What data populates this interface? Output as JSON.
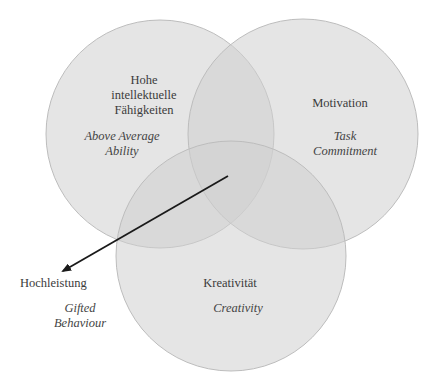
{
  "diagram": {
    "colors": {
      "circle_fill": "#cfcfcf",
      "circle_stroke": "#bdbdbd",
      "arrow": "#1a1a1a",
      "text": "#3b3b3b"
    },
    "circles": [
      {
        "id": "ability",
        "label_de": [
          "Hohe",
          "intellektuelle",
          "Fähigkeiten"
        ],
        "label_en": [
          "Above Average",
          "Ability"
        ],
        "cx": 160,
        "cy": 134,
        "r": 114
      },
      {
        "id": "motivation",
        "label_de": [
          "Motivation"
        ],
        "label_en": [
          "Task",
          "Commitment"
        ],
        "cx": 303,
        "cy": 134,
        "r": 115
      },
      {
        "id": "creativity",
        "label_de": [
          "Kreativität"
        ],
        "label_en": [
          "Creativity"
        ],
        "cx": 231,
        "cy": 256,
        "r": 115
      }
    ],
    "outcome": {
      "label_de": "Hochleistung",
      "label_en": [
        "Gifted",
        "Behaviour"
      ]
    },
    "arrow": {
      "x1": 228,
      "y1": 176,
      "x2": 63,
      "y2": 271
    }
  }
}
